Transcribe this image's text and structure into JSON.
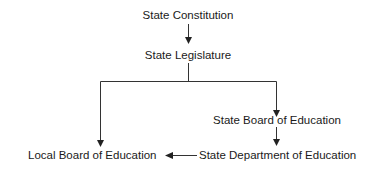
{
  "diagram": {
    "type": "hierarchy-flowchart",
    "nodes": [
      {
        "id": "state_constitution",
        "label": "State Constitution"
      },
      {
        "id": "state_legislature",
        "label": "State Legislature"
      },
      {
        "id": "state_board",
        "label": "State Board of Education"
      },
      {
        "id": "state_department",
        "label": "State Department of Education"
      },
      {
        "id": "local_board",
        "label": "Local Board of Education"
      }
    ],
    "edges": [
      {
        "from": "state_constitution",
        "to": "state_legislature"
      },
      {
        "from": "state_legislature",
        "to": "local_board"
      },
      {
        "from": "state_legislature",
        "to": "state_board"
      },
      {
        "from": "state_board",
        "to": "state_department"
      },
      {
        "from": "state_department",
        "to": "local_board"
      }
    ],
    "colors": {
      "line": "#333333",
      "text": "#1a1a1a",
      "background": "#ffffff"
    }
  }
}
